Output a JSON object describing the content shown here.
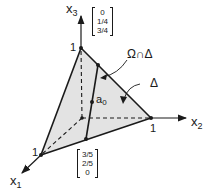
{
  "diagram": {
    "axes": {
      "x1": {
        "name": "x",
        "sub": "1"
      },
      "x2": {
        "name": "x",
        "sub": "2"
      },
      "x3": {
        "name": "x",
        "sub": "3"
      }
    },
    "ticks": {
      "x1_one": "1",
      "x2_one": "1",
      "x3_one": "1"
    },
    "vectors": {
      "top": [
        "0",
        "1/4",
        "3/4"
      ],
      "bottom": [
        "3/5",
        "2/5",
        "0"
      ]
    },
    "labels": {
      "intersection": "Ω∩Δ",
      "simplex": "Δ",
      "point_name": "a",
      "point_sub": "0"
    },
    "colors": {
      "fill": "#e3e3e3",
      "stroke": "#1a1a1a"
    }
  }
}
